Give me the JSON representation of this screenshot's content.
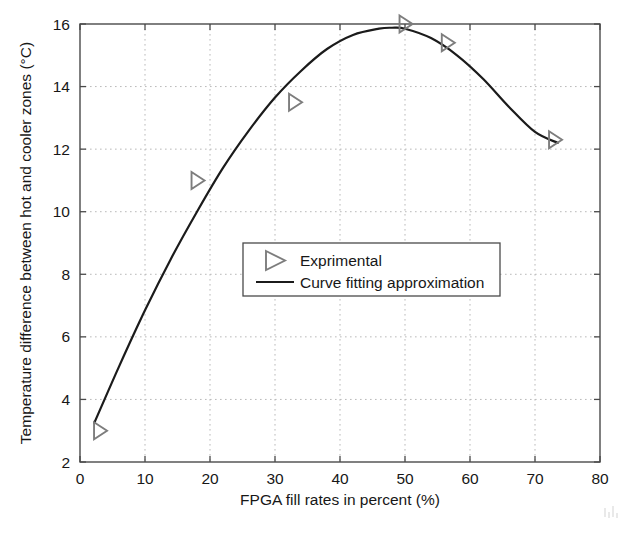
{
  "chart_data": {
    "type": "scatter",
    "title": "",
    "xlabel": "FPGA fill rates in percent (%)",
    "ylabel": "Temperature difference between hot and cooler zones (°C)",
    "xlim": [
      0,
      80
    ],
    "ylim": [
      2,
      16
    ],
    "xticks": [
      "0",
      "10",
      "20",
      "30",
      "40",
      "50",
      "60",
      "70",
      "80"
    ],
    "xtick_values": [
      0,
      10,
      20,
      30,
      40,
      50,
      60,
      70,
      80
    ],
    "yticks": [
      "2",
      "4",
      "6",
      "8",
      "10",
      "12",
      "14",
      "16"
    ],
    "ytick_values": [
      2,
      4,
      6,
      8,
      10,
      12,
      14,
      16
    ],
    "grid": "dotted",
    "legend_position": "center",
    "series": [
      {
        "name": "Exprimental",
        "type": "scatter",
        "marker": "right-triangle-open",
        "color": "#7d7d7d",
        "x": [
          3,
          18,
          33,
          50,
          56.5,
          73
        ],
        "y": [
          3.0,
          11.0,
          13.5,
          16.0,
          15.4,
          12.3
        ]
      },
      {
        "name": "Curve fitting approximation",
        "type": "line",
        "color": "#1b1b1b",
        "x": [
          2.2,
          6,
          10,
          14,
          18,
          22,
          26,
          30,
          34,
          38,
          42,
          46,
          48,
          50,
          54,
          58,
          62,
          66,
          70,
          73.5
        ],
        "y": [
          3.25,
          5.05,
          6.85,
          8.5,
          10.0,
          11.4,
          12.6,
          13.65,
          14.5,
          15.2,
          15.65,
          15.85,
          15.88,
          15.85,
          15.55,
          15.0,
          14.25,
          13.35,
          12.55,
          12.2
        ]
      }
    ]
  },
  "legend": {
    "items": [
      {
        "label": "Exprimental",
        "symbol": "right-triangle-open"
      },
      {
        "label": "Curve fitting approximation",
        "symbol": "line"
      }
    ]
  },
  "axes": {
    "x_title": "FPGA fill rates in percent (%)",
    "y_title": "Temperature difference between hot and cooler zones (°C)"
  }
}
